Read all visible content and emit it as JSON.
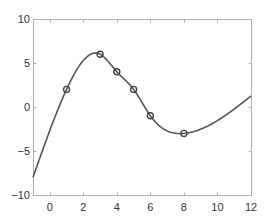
{
  "chart_data": {
    "type": "line",
    "title": "",
    "xlabel": "",
    "ylabel": "",
    "xlim": [
      -1,
      12
    ],
    "ylim": [
      -10,
      10
    ],
    "grid": false,
    "legend": null,
    "x_ticks": [
      0,
      2,
      4,
      6,
      8,
      10,
      12
    ],
    "x_tick_labels": [
      "0",
      "2",
      "4",
      "6",
      "8",
      "10",
      "12"
    ],
    "y_ticks": [
      -10,
      -5,
      0,
      5,
      10
    ],
    "y_tick_labels": [
      "−10",
      "−5",
      "0",
      "5",
      "10"
    ],
    "series": [
      {
        "name": "interpolating curve",
        "style": "line",
        "color": "#555555",
        "x": [
          -1,
          1,
          3,
          4,
          5,
          6,
          8,
          12
        ],
        "y": [
          -8,
          2,
          6,
          4,
          2,
          -1,
          -3,
          1.25
        ]
      },
      {
        "name": "data points",
        "style": "circle-markers",
        "color": "#444444",
        "x": [
          1,
          3,
          4,
          5,
          6,
          8
        ],
        "y": [
          2,
          6,
          4,
          2,
          -1,
          -3
        ]
      }
    ]
  },
  "layout": {
    "plot_left": 33,
    "plot_top": 19,
    "plot_right": 251,
    "plot_bottom": 195,
    "axis_color": "#b0b0b0",
    "tick_label_color": "#333333"
  }
}
